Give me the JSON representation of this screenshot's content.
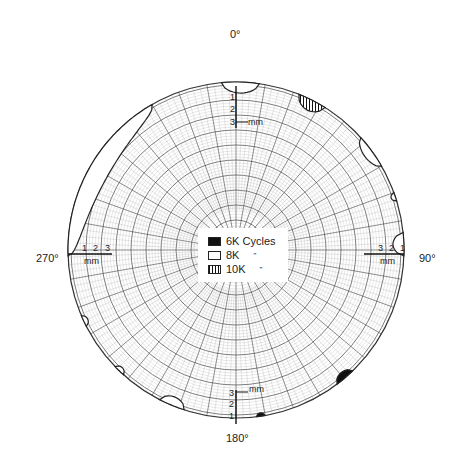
{
  "chart_data": {
    "type": "polar-wear-map",
    "title": "",
    "angular_axis": {
      "labels": [
        "0°",
        "90°",
        "180°",
        "270°"
      ],
      "positions_deg": [
        0,
        90,
        180,
        270
      ]
    },
    "radial_scale": {
      "unit": "mm",
      "ticks": [
        "1",
        "2",
        "3"
      ],
      "note": "depth scale measured inward from rim at 0°, 90°, 180°, 270°"
    },
    "legend": [
      {
        "label": "6K Cycles",
        "fill": "solid-black"
      },
      {
        "label": "8K",
        "ditto": "\"",
        "fill": "open-white"
      },
      {
        "label": "10K",
        "ditto": "\"",
        "fill": "vertical-hatch"
      }
    ],
    "regions": [
      {
        "series": "8K",
        "angle_start": 355,
        "angle_end": 8,
        "depth_mm": 1.0
      },
      {
        "series": "10K",
        "angle_start": 22,
        "angle_end": 32,
        "depth_mm": 1.0
      },
      {
        "series": "8K",
        "angle_start": 48,
        "angle_end": 60,
        "depth_mm": 0.8
      },
      {
        "series": "8K",
        "angle_start": 70,
        "angle_end": 73,
        "depth_mm": 0.4
      },
      {
        "series": "8K",
        "angle_start": 84,
        "angle_end": 92,
        "depth_mm": 1.0
      },
      {
        "series": "6K Cycles",
        "angle_start": 136,
        "angle_end": 143,
        "depth_mm": 0.6
      },
      {
        "series": "6K Cycles",
        "angle_start": 170,
        "angle_end": 173,
        "depth_mm": 0.3
      },
      {
        "series": "8K",
        "angle_start": 198,
        "angle_end": 207,
        "depth_mm": 0.8
      },
      {
        "series": "8K",
        "angle_start": 222,
        "angle_end": 226,
        "depth_mm": 0.4
      },
      {
        "series": "8K",
        "angle_start": 243,
        "angle_end": 247,
        "depth_mm": 0.4
      },
      {
        "series": "8K",
        "angle_start": 268,
        "angle_end": 330,
        "depth_mm": 1.8
      }
    ],
    "grid": true
  },
  "labels": {
    "top": "0°",
    "right": "90°",
    "bottom": "180°",
    "left": "270°",
    "mm": "mm",
    "t1": "1",
    "t2": "2",
    "t3": "3"
  },
  "legend": {
    "row1": "6K Cycles",
    "row2": "8K",
    "row2_ditto": "\"",
    "row3": "10K",
    "row3_ditto": "\""
  }
}
